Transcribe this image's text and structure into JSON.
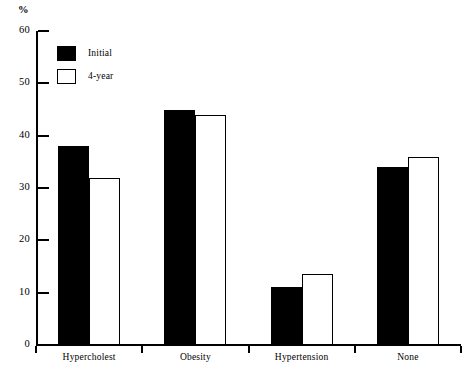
{
  "chart_data": {
    "type": "bar",
    "title": "",
    "subtitle": "",
    "xlabel": "",
    "ylabel": "%",
    "ylim": [
      0,
      60
    ],
    "yticks": [
      0,
      10,
      20,
      30,
      40,
      50,
      60
    ],
    "ytick_labels": [
      "0",
      "10",
      "20",
      "30",
      "40",
      "50",
      "60"
    ],
    "grid": false,
    "legend_position": "upper-left",
    "categories": [
      "Hypercholest",
      "Obesity",
      "Hypertension",
      "None"
    ],
    "series": [
      {
        "name": "Initial",
        "color": "#000000",
        "fill": "solid",
        "values": [
          38,
          45,
          11,
          34
        ]
      },
      {
        "name": "4-year",
        "color": "#ffffff",
        "fill": "outline",
        "values": [
          32,
          44,
          13.5,
          36
        ]
      }
    ],
    "annotations": []
  },
  "axes": {
    "y_title": "%"
  },
  "legend": {
    "items": [
      {
        "label": "Initial",
        "swatch": "filled-black-square"
      },
      {
        "label": "4-year",
        "swatch": "outlined-white-square"
      }
    ]
  }
}
